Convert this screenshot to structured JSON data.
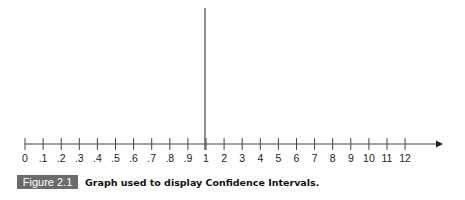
{
  "figure": {
    "label": "Figure 2.1",
    "caption": "Graph used to display Confidence Intervals."
  },
  "axis": {
    "tick_labels": [
      "0",
      ".1",
      ".2",
      ".3",
      ".4",
      ".5",
      ".6",
      ".7",
      ".8",
      ".9",
      "1",
      "2",
      "3",
      "4",
      "5",
      "6",
      "7",
      "8",
      "9",
      "10",
      "11",
      "12"
    ],
    "reference_line_at": "1",
    "arrow": "right"
  },
  "colors": {
    "axis": "#333333",
    "badge_bg": "#6b6b6b",
    "badge_text": "#ffffff"
  }
}
